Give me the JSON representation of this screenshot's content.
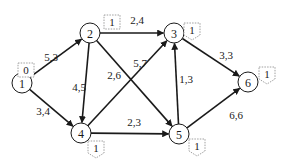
{
  "diagram": {
    "type": "directed-graph",
    "nodes": [
      {
        "id": "1",
        "label": "1",
        "x": 22,
        "y": 83,
        "tag": "0",
        "tag_shape": "rect",
        "tag_x": 26,
        "tag_y": 70
      },
      {
        "id": "2",
        "label": "2",
        "x": 90,
        "y": 33,
        "tag": "1",
        "tag_shape": "rect",
        "tag_x": 112,
        "tag_y": 22
      },
      {
        "id": "3",
        "label": "3",
        "x": 174,
        "y": 33,
        "tag": "1",
        "tag_shape": "pentagon",
        "tag_x": 192,
        "tag_y": 30
      },
      {
        "id": "4",
        "label": "4",
        "x": 81,
        "y": 133,
        "tag": "1",
        "tag_shape": "pentagon",
        "tag_x": 96,
        "tag_y": 148
      },
      {
        "id": "5",
        "label": "5",
        "x": 179,
        "y": 134,
        "tag": "1",
        "tag_shape": "pentagon",
        "tag_x": 197,
        "tag_y": 146
      },
      {
        "id": "6",
        "label": "6",
        "x": 248,
        "y": 82,
        "tag": "1",
        "tag_shape": "pentagon",
        "tag_x": 267,
        "tag_y": 74
      }
    ],
    "edges": [
      {
        "from": "1",
        "to": "2",
        "label": "5,3",
        "lx": 51,
        "ly": 57
      },
      {
        "from": "1",
        "to": "4",
        "label": "3,4",
        "lx": 43,
        "ly": 111
      },
      {
        "from": "2",
        "to": "3",
        "label": "2,4",
        "lx": 137,
        "ly": 20
      },
      {
        "from": "2",
        "to": "4",
        "label": "4,5",
        "lx": 79,
        "ly": 87
      },
      {
        "from": "2",
        "to": "5",
        "label": "2,6",
        "lx": 114,
        "ly": 75
      },
      {
        "from": "4",
        "to": "3",
        "label": "5,7",
        "lx": 140,
        "ly": 63
      },
      {
        "from": "4",
        "to": "5",
        "label": "2,3",
        "lx": 134,
        "ly": 122
      },
      {
        "from": "5",
        "to": "3",
        "label": "1,3",
        "lx": 186,
        "ly": 79
      },
      {
        "from": "3",
        "to": "6",
        "label": "3,3",
        "lx": 226,
        "ly": 55
      },
      {
        "from": "5",
        "to": "6",
        "label": "6,6",
        "lx": 236,
        "ly": 115
      }
    ],
    "colors": {
      "stroke": "#1a1a1a",
      "tag_border": "#888888",
      "background": "#ffffff"
    }
  }
}
